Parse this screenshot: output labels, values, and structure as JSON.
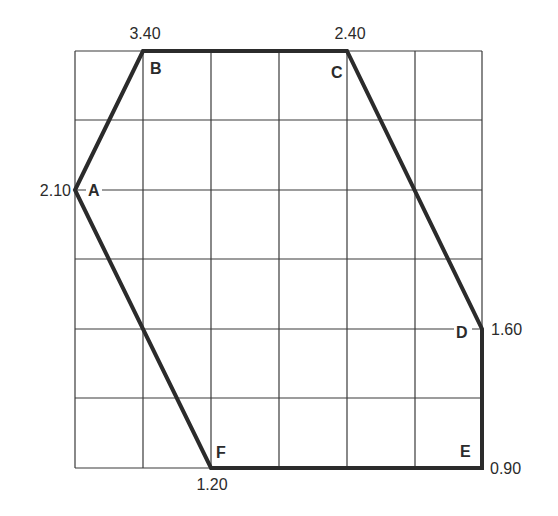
{
  "diagram": {
    "type": "grid-polygon",
    "grid": {
      "columns": 6,
      "rows": 6,
      "line_color": "#3a3a3a",
      "outline_color": "#2b2b2b"
    },
    "points": [
      {
        "id": "A",
        "label": "A",
        "value": "2.10",
        "col": 0,
        "row": 2
      },
      {
        "id": "B",
        "label": "B",
        "value": "3.40",
        "col": 1,
        "row": 0
      },
      {
        "id": "C",
        "label": "C",
        "value": "2.40",
        "col": 4,
        "row": 0
      },
      {
        "id": "D",
        "label": "D",
        "value": "1.60",
        "col": 6,
        "row": 4
      },
      {
        "id": "E",
        "label": "E",
        "value": "0.90",
        "col": 6,
        "row": 6
      },
      {
        "id": "F",
        "label": "F",
        "value": "1.20",
        "col": 2,
        "row": 6
      }
    ],
    "polygon_order": [
      "A",
      "B",
      "C",
      "D",
      "E",
      "F"
    ]
  }
}
